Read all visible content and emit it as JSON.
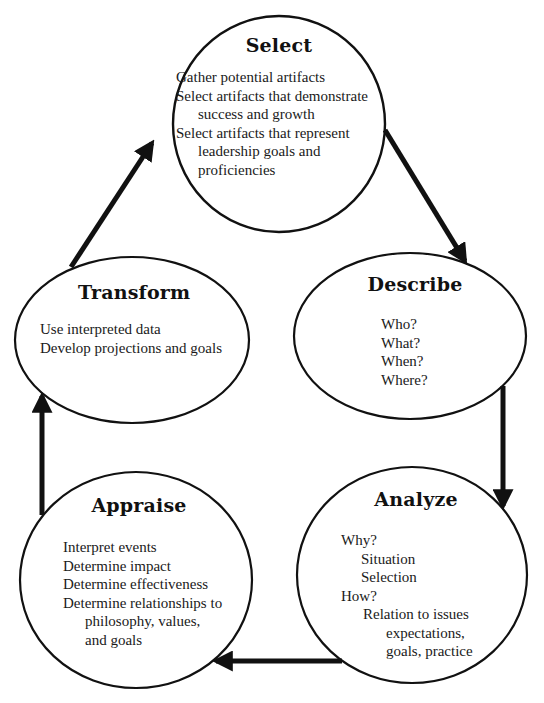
{
  "diagram": {
    "type": "cycle",
    "line_color": "#111111",
    "nodes": {
      "select": {
        "title": "Select",
        "lines": [
          {
            "text": "Gather potential artifacts",
            "indent": 0
          },
          {
            "text": "Select artifacts that demonstrate",
            "indent": 0
          },
          {
            "text": "success and growth",
            "indent": 1
          },
          {
            "text": "Select artifacts that represent",
            "indent": 0
          },
          {
            "text": "leadership goals and",
            "indent": 1
          },
          {
            "text": "proficiencies",
            "indent": 1
          }
        ]
      },
      "describe": {
        "title": "Describe",
        "lines": [
          {
            "text": "Who?",
            "indent": 0
          },
          {
            "text": "What?",
            "indent": 0
          },
          {
            "text": "When?",
            "indent": 0
          },
          {
            "text": "Where?",
            "indent": 0
          }
        ]
      },
      "analyze": {
        "title": "Analyze",
        "lines": [
          {
            "text": "Why?",
            "indent": 0
          },
          {
            "text": "Situation",
            "indent": 1
          },
          {
            "text": "Selection",
            "indent": 1
          },
          {
            "text": "How?",
            "indent": 0
          },
          {
            "text": "Relation to issues",
            "indent": 1
          },
          {
            "text": "expectations,",
            "indent": 2
          },
          {
            "text": "goals, practice",
            "indent": 2
          }
        ]
      },
      "appraise": {
        "title": "Appraise",
        "lines": [
          {
            "text": "Interpret events",
            "indent": 0
          },
          {
            "text": "Determine impact",
            "indent": 0
          },
          {
            "text": "Determine effectiveness",
            "indent": 0
          },
          {
            "text": "Determine relationships to",
            "indent": 0
          },
          {
            "text": "philosophy, values,",
            "indent": 1
          },
          {
            "text": "and goals",
            "indent": 1
          }
        ]
      },
      "transform": {
        "title": "Transform",
        "lines": [
          {
            "text": "Use interpreted data",
            "indent": 0
          },
          {
            "text": "Develop projections and goals",
            "indent": 0
          }
        ]
      }
    },
    "edges": [
      {
        "from": "select",
        "to": "describe"
      },
      {
        "from": "describe",
        "to": "analyze"
      },
      {
        "from": "analyze",
        "to": "appraise"
      },
      {
        "from": "appraise",
        "to": "transform"
      },
      {
        "from": "transform",
        "to": "select"
      }
    ]
  }
}
